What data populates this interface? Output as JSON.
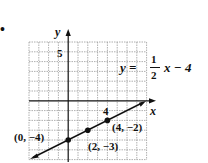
{
  "bullet": "•",
  "graph": {
    "x_axis_label": "x",
    "y_axis_label": "y",
    "y_tick_label": "5",
    "x_tick_label": "4",
    "equation": {
      "lhs": "y =",
      "num": "1",
      "den": "2",
      "rhs": "x − 4"
    },
    "points": [
      {
        "label": "(0, −4)",
        "x": 0,
        "y": -4
      },
      {
        "label": "(2, −3)",
        "x": 2,
        "y": -3
      },
      {
        "label": "(4, −2)",
        "x": 4,
        "y": -2
      }
    ],
    "grid": {
      "xmin": -4,
      "xmax": 8,
      "ymin": -6,
      "ymax": 6
    },
    "line_color": "#111111",
    "grid_color": "#9a9a9a"
  }
}
